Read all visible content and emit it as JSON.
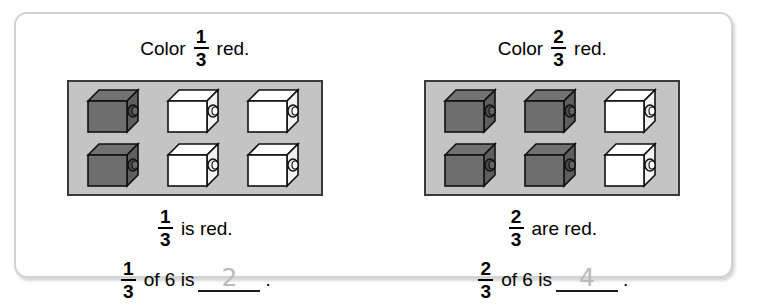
{
  "worksheet": {
    "problems": [
      {
        "prompt": {
          "lead": "Color",
          "fraction": {
            "numerator": "1",
            "denominator": "3"
          },
          "trail": "red."
        },
        "panel": {
          "label": "unit-cubes-grid",
          "rows": 2,
          "columns": 3,
          "total_cubes": 6,
          "colored_cubes": 2,
          "cubes": [
            [
              "dark",
              "white",
              "white"
            ],
            [
              "dark",
              "white",
              "white"
            ]
          ],
          "panel_color": "#c4c4c4",
          "dark_cube_color": "#6e6e6e",
          "white_cube_color": "#ffffff"
        },
        "statement": {
          "fraction": {
            "numerator": "1",
            "denominator": "3"
          },
          "text": "is red."
        },
        "equation": {
          "fraction": {
            "numerator": "1",
            "denominator": "3"
          },
          "text_before": "of 6 is",
          "answer": "2",
          "period": "."
        }
      },
      {
        "prompt": {
          "lead": "Color",
          "fraction": {
            "numerator": "2",
            "denominator": "3"
          },
          "trail": "red."
        },
        "panel": {
          "label": "unit-cubes-grid",
          "rows": 2,
          "columns": 3,
          "total_cubes": 6,
          "colored_cubes": 4,
          "cubes": [
            [
              "dark",
              "dark",
              "white"
            ],
            [
              "dark",
              "dark",
              "white"
            ]
          ],
          "panel_color": "#c4c4c4",
          "dark_cube_color": "#6e6e6e",
          "white_cube_color": "#ffffff"
        },
        "statement": {
          "fraction": {
            "numerator": "2",
            "denominator": "3"
          },
          "text": "are red."
        },
        "equation": {
          "fraction": {
            "numerator": "2",
            "denominator": "3"
          },
          "text_before": "of 6 is",
          "answer": "4",
          "period": "."
        }
      }
    ]
  }
}
